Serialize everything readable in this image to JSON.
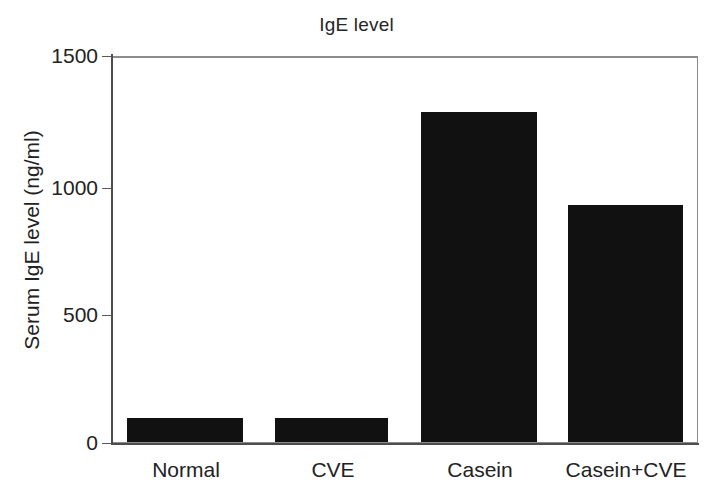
{
  "chart_data": {
    "type": "bar",
    "title": "IgE level",
    "xlabel": "",
    "ylabel": "Serum IgE level (ng/ml)",
    "categories": [
      "Normal",
      "CVE",
      "Casein",
      "Casein+CVE"
    ],
    "values": [
      95,
      95,
      1290,
      925
    ],
    "ylim": [
      0,
      1500
    ],
    "yticks": [
      0,
      500,
      1000,
      1500
    ],
    "ytick_labels": [
      "0",
      "500",
      "1000",
      "1500"
    ],
    "grid": "horizontal",
    "legend": "none",
    "bar_color": "#111111",
    "series": [
      {
        "name": "Serum IgE level",
        "values": [
          95,
          95,
          1290,
          925
        ]
      }
    ]
  },
  "figure": {
    "background": "#ffffff",
    "frame_color": "#8c8c8c",
    "axis_color": "#4d4d4d",
    "gridline_color": "#bfbfbf",
    "text_color": "#222222"
  }
}
